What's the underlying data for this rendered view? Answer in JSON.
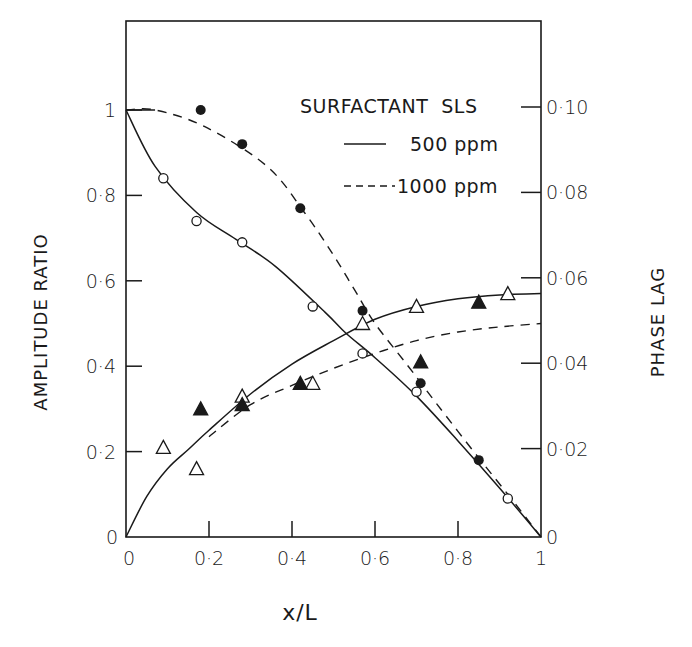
{
  "chart_data": {
    "type": "scatter",
    "title": "",
    "xlabel": "x/L",
    "ylabel": "AMPLITUDE RATIO",
    "ylabel_right": "PHASE LAG",
    "xlim": [
      0,
      1
    ],
    "ylim": [
      0,
      1.2
    ],
    "ylim_right": [
      0,
      0.12
    ],
    "grid": false,
    "x_ticks": [
      {
        "value": 0,
        "label": "0"
      },
      {
        "value": 0.2,
        "label": "0·2"
      },
      {
        "value": 0.4,
        "label": "0·4"
      },
      {
        "value": 0.6,
        "label": "0·6"
      },
      {
        "value": 0.8,
        "label": "0·8"
      },
      {
        "value": 1,
        "label": "1"
      }
    ],
    "y_ticks": [
      {
        "value": 0,
        "label": "0"
      },
      {
        "value": 0.2,
        "label": "0·2"
      },
      {
        "value": 0.4,
        "label": "0·4"
      },
      {
        "value": 0.6,
        "label": "0·6"
      },
      {
        "value": 0.8,
        "label": "0·8"
      },
      {
        "value": 1,
        "label": "1"
      }
    ],
    "y_ticks_right": [
      {
        "value": 0,
        "label": "0"
      },
      {
        "value": 0.02,
        "label": "0·02"
      },
      {
        "value": 0.04,
        "label": "0·04"
      },
      {
        "value": 0.06,
        "label": "0·06"
      },
      {
        "value": 0.08,
        "label": "0·08"
      },
      {
        "value": 0.1,
        "label": "0·10"
      }
    ],
    "legend": {
      "title": "SURFACTANT  SLS",
      "position": "upper right",
      "entries": [
        {
          "label": "500 ppm",
          "style": "solid"
        },
        {
          "label": "1000 ppm",
          "style": "dashed"
        }
      ]
    },
    "series": [
      {
        "name": "Amplitude ratio, 500 ppm (measured)",
        "axis": "left",
        "marker": "open-circle",
        "x": [
          0.09,
          0.17,
          0.28,
          0.45,
          0.57,
          0.7,
          0.92
        ],
        "y": [
          0.84,
          0.74,
          0.69,
          0.54,
          0.43,
          0.34,
          0.09
        ]
      },
      {
        "name": "Amplitude ratio, 1000 ppm (measured)",
        "axis": "left",
        "marker": "filled-circle",
        "x": [
          0.18,
          0.28,
          0.42,
          0.57,
          0.71,
          0.85
        ],
        "y": [
          1.0,
          0.92,
          0.77,
          0.53,
          0.36,
          0.18
        ]
      },
      {
        "name": "Phase lag, 500 ppm (measured)",
        "axis": "right",
        "marker": "open-triangle",
        "x": [
          0.09,
          0.17,
          0.28,
          0.45,
          0.57,
          0.7,
          0.92
        ],
        "y": [
          0.021,
          0.016,
          0.033,
          0.036,
          0.05,
          0.054,
          0.057
        ]
      },
      {
        "name": "Phase lag, 1000 ppm (measured)",
        "axis": "right",
        "marker": "filled-triangle",
        "x": [
          0.18,
          0.28,
          0.42,
          0.71,
          0.85
        ],
        "y": [
          0.03,
          0.031,
          0.036,
          0.041,
          0.055
        ]
      },
      {
        "name": "Amplitude ratio, 500 ppm (fit)",
        "axis": "left",
        "line": "solid",
        "x": [
          0,
          0.07,
          0.17,
          0.265,
          0.36,
          0.48,
          0.53,
          0.6,
          0.7,
          0.8,
          0.9,
          1.0
        ],
        "y": [
          1.0,
          0.868,
          0.76,
          0.697,
          0.634,
          0.526,
          0.477,
          0.42,
          0.33,
          0.225,
          0.115,
          0.0
        ]
      },
      {
        "name": "Amplitude ratio, 1000 ppm (fit)",
        "axis": "left",
        "line": "dashed",
        "x": [
          0,
          0.07,
          0.19,
          0.34,
          0.43,
          0.5,
          0.55,
          0.6,
          0.68,
          0.75,
          0.85,
          0.92,
          1.0
        ],
        "y": [
          1.0,
          1.0,
          0.961,
          0.868,
          0.76,
          0.66,
          0.58,
          0.5,
          0.4,
          0.31,
          0.185,
          0.1,
          0.0
        ]
      },
      {
        "name": "Phase lag, 500 ppm (fit)",
        "axis": "right",
        "line": "solid",
        "x": [
          0,
          0.05,
          0.1,
          0.15,
          0.2,
          0.3,
          0.4,
          0.5,
          0.6,
          0.7,
          0.8,
          0.9,
          1.0
        ],
        "y": [
          0,
          0.0095,
          0.016,
          0.0205,
          0.025,
          0.0335,
          0.0405,
          0.046,
          0.051,
          0.054,
          0.0558,
          0.0567,
          0.057
        ]
      },
      {
        "name": "Phase lag, 1000 ppm (fit)",
        "axis": "right",
        "line": "dashed",
        "x": [
          0.2,
          0.3,
          0.4,
          0.5,
          0.6,
          0.7,
          0.8,
          0.9,
          1.0
        ],
        "y": [
          0.0235,
          0.031,
          0.0355,
          0.0395,
          0.043,
          0.046,
          0.048,
          0.0492,
          0.05
        ]
      }
    ]
  }
}
